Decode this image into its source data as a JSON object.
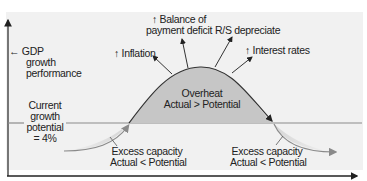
{
  "diagram": {
    "y_axis_label": "← GDP growth performance",
    "y_axis_lines": [
      "← GDP",
      "growth",
      "performance"
    ],
    "potential_label_lines": [
      "Current",
      "growth",
      "potential",
      "= 4%"
    ],
    "overheat": {
      "title": "Overheat",
      "condition": "Actual > Potential"
    },
    "excess_left": {
      "title": "Excess capacity",
      "condition": "Actual < Potential"
    },
    "excess_right": {
      "title": "Excess capacity",
      "condition": "Actual < Potential"
    },
    "effects": [
      {
        "text": "↑ Inflation"
      },
      {
        "lines": [
          "↑ Balance of",
          "payment deficit"
        ]
      },
      {
        "text": "R/S depreciate"
      },
      {
        "text": "↑ Interest rates"
      }
    ],
    "colors": {
      "panel": "#f1f1f1",
      "hump_fill": "#c6c6c6",
      "curve": "#333333",
      "arrow_gray": "#8a8a8a",
      "potential_line": "#8c8c8c"
    }
  }
}
